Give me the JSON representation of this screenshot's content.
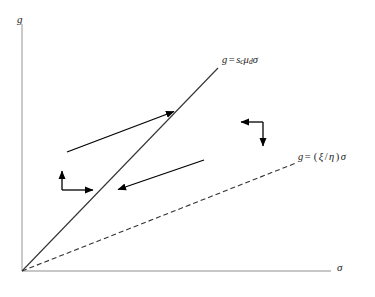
{
  "figure": {
    "type": "phase-diagram",
    "background_color": "#ffffff"
  },
  "axes": {
    "y_label": "g",
    "x_label": "σ",
    "color": "#b4b4b4",
    "origin": {
      "x": 22,
      "y": 271
    },
    "y_top": {
      "x": 22,
      "y": 24
    },
    "x_right": {
      "x": 331,
      "y": 271
    }
  },
  "labels": {
    "solid_line": {
      "lhs": "g",
      "operator": "=",
      "coef1": "s",
      "coef1_sub": "c",
      "coef2": "μ",
      "coef2_sub": "d",
      "variable": "σ",
      "full_text": "g = s_cμ_dσ"
    },
    "dashed_line": {
      "lhs": "g",
      "operator": "=",
      "open_paren": "(",
      "numerator": "ξ",
      "slash": "/",
      "denominator": "η",
      "close_paren": ")",
      "variable": "σ",
      "full_text": "g = (ξ/η)σ"
    }
  },
  "chart_data": {
    "type": "line",
    "title": "",
    "xlabel": "σ",
    "ylabel": "g",
    "grid": false,
    "legend": "none",
    "xlim": [
      0,
      331
    ],
    "ylim": [
      0,
      271
    ],
    "series": [
      {
        "name": "g = s_cμ_dσ",
        "style": "solid",
        "color": "#333333",
        "width": 1.1,
        "points": [
          [
            22,
            271
          ],
          [
            218,
            68
          ]
        ],
        "through_origin": true,
        "slope_description": "steep ray from origin"
      },
      {
        "name": "g = (ξ/η)σ",
        "style": "dashed",
        "color": "#333333",
        "width": 1.1,
        "dash_pattern": "5,3",
        "points": [
          [
            22,
            271
          ],
          [
            296,
            163
          ]
        ],
        "through_origin": true,
        "slope_description": "shallow ray from origin"
      }
    ],
    "annotations": [
      {
        "name": "upper-diagonal-arrow",
        "kind": "arrow",
        "from": [
          67,
          152
        ],
        "to": [
          178,
          110
        ],
        "direction": "up-right"
      },
      {
        "name": "lower-diagonal-arrow",
        "kind": "arrow",
        "from": [
          204,
          160
        ],
        "to": [
          114,
          191
        ],
        "direction": "down-left"
      },
      {
        "name": "left-corner-arrow-pair",
        "kind": "corner-arrows",
        "corner": [
          62,
          190
        ],
        "up_tip": [
          62,
          167
        ],
        "right_tip": [
          97,
          190
        ],
        "description": "up arrow and right arrow sharing a corner"
      },
      {
        "name": "right-corner-arrow-pair",
        "kind": "corner-arrows",
        "corner": [
          263,
          122
        ],
        "left_tip": [
          237,
          122
        ],
        "down_tip": [
          263,
          150
        ],
        "description": "left arrow and down arrow sharing a corner"
      }
    ]
  }
}
